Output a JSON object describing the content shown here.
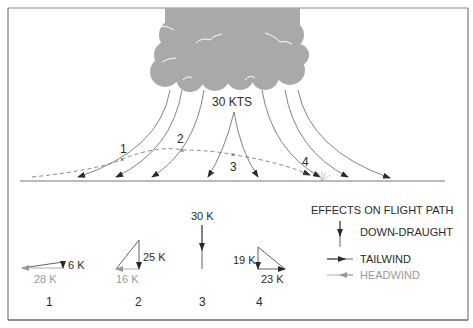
{
  "diagram": {
    "cloud_label": "30 KTS",
    "path_points": [
      {
        "id": "1",
        "label": "1"
      },
      {
        "id": "2",
        "label": "2"
      },
      {
        "id": "3",
        "label": "3"
      },
      {
        "id": "4",
        "label": "4"
      }
    ],
    "vectors": [
      {
        "position": "1",
        "vertical": "6 K",
        "horizontal": "28 K",
        "horizontal_type": "headwind"
      },
      {
        "position": "2",
        "vertical": "25 K",
        "horizontal": "16 K",
        "horizontal_type": "headwind"
      },
      {
        "position": "3",
        "vertical": "30 K",
        "horizontal": "",
        "horizontal_type": "none"
      },
      {
        "position": "4",
        "vertical": "19 K",
        "horizontal": "23 K",
        "horizontal_type": "tailwind"
      }
    ],
    "legend": {
      "title": "EFFECTS ON FLIGHT PATH",
      "items": [
        {
          "label": "DOWN-DRAUGHT",
          "icon": "down-arrow-icon"
        },
        {
          "label": "TAILWIND",
          "icon": "right-arrow-icon"
        },
        {
          "label": "HEADWIND",
          "icon": "left-arrow-icon"
        }
      ]
    },
    "colors": {
      "cloud": "#a9a9a9",
      "line": "#3a3a3a",
      "headwind": "#9a9a9a",
      "frame": "#7a7a7a"
    }
  }
}
